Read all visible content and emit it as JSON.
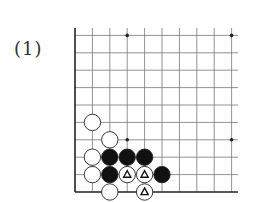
{
  "problem_label": "(1)",
  "board": {
    "origin_x": 75,
    "bottom_y": 192,
    "spacing": 17.4,
    "cols": 10,
    "rows": 10,
    "right_x": 238,
    "top_y": 28,
    "star_points": [
      [
        3,
        9
      ],
      [
        9,
        9
      ],
      [
        3,
        3
      ],
      [
        9,
        3
      ]
    ],
    "stones": [
      {
        "color": "white",
        "col": 1,
        "row": 4
      },
      {
        "color": "white",
        "col": 2,
        "row": 3
      },
      {
        "color": "white",
        "col": 1,
        "row": 2
      },
      {
        "color": "black",
        "col": 2,
        "row": 2
      },
      {
        "color": "black",
        "col": 3,
        "row": 2
      },
      {
        "color": "black",
        "col": 4,
        "row": 2
      },
      {
        "color": "white",
        "col": 1,
        "row": 1
      },
      {
        "color": "black",
        "col": 2,
        "row": 1
      },
      {
        "color": "white",
        "col": 3,
        "row": 1,
        "mark": "triangle"
      },
      {
        "color": "white",
        "col": 4,
        "row": 1,
        "mark": "triangle"
      },
      {
        "color": "black",
        "col": 5,
        "row": 1
      },
      {
        "color": "white",
        "col": 2,
        "row": 0
      },
      {
        "color": "white",
        "col": 4,
        "row": 0,
        "mark": "triangle"
      }
    ]
  }
}
